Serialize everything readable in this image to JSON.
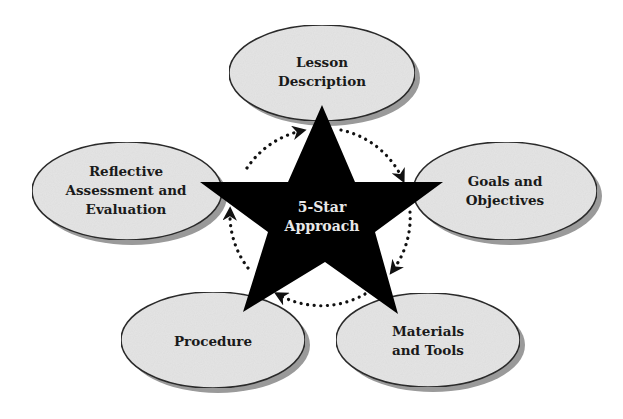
{
  "diagram": {
    "center": {
      "line1": "5-Star",
      "line2": "Approach",
      "shape": "star",
      "fill": "#000000",
      "text_color": "#e8e8e8"
    },
    "nodes": [
      {
        "id": "lesson-description",
        "lines": [
          "Lesson",
          "Description"
        ]
      },
      {
        "id": "goals-objectives",
        "lines": [
          "Goals and",
          "Objectives"
        ]
      },
      {
        "id": "materials-tools",
        "lines": [
          "Materials",
          "and Tools"
        ]
      },
      {
        "id": "procedure",
        "lines": [
          "Procedure"
        ]
      },
      {
        "id": "reflective-assessment",
        "lines": [
          "Reflective",
          "Assessment and",
          "Evaluation"
        ]
      }
    ],
    "cycle": {
      "style": "dotted",
      "direction": "clockwise",
      "order": [
        "Lesson Description",
        "Goals and Objectives",
        "Materials and Tools",
        "Procedure",
        "Reflective Assessment and Evaluation"
      ]
    },
    "colors": {
      "ellipse_fill": "#e4e4e4",
      "ellipse_stroke": "#2a2a2a",
      "ellipse_shadow": "#9a9a9a",
      "arrow": "#111111"
    }
  }
}
